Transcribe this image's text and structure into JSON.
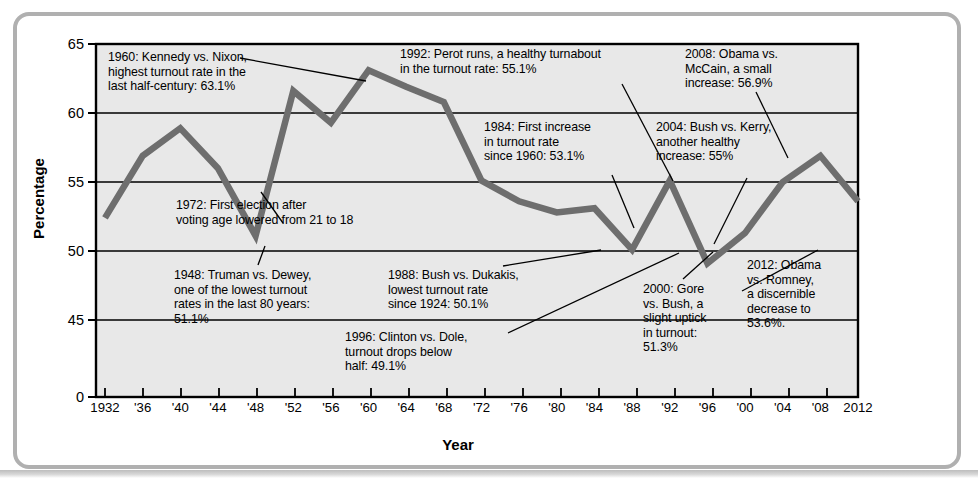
{
  "chart_data": {
    "type": "line",
    "title": "",
    "xlabel": "Year",
    "ylabel": "Percentage",
    "ylim": [
      44,
      65
    ],
    "yticks": [
      "0",
      "45",
      "50",
      "55",
      "60",
      "65"
    ],
    "grid": true,
    "legend": "none",
    "x": [
      1932,
      1936,
      1940,
      1944,
      1948,
      1952,
      1956,
      1960,
      1964,
      1968,
      1972,
      1976,
      1980,
      1984,
      1988,
      1992,
      1996,
      2000,
      2004,
      2008,
      2012
    ],
    "xtick_labels": [
      "1932",
      "'36",
      "'40",
      "'44",
      "'48",
      "'52",
      "'56",
      "'60",
      "'64",
      "'68",
      "'72",
      "'76",
      "'80",
      "'84",
      "'88",
      "'92",
      "'96",
      "'00",
      "'04",
      "'08",
      "2012"
    ],
    "values": [
      52.4,
      56.9,
      58.9,
      56.0,
      51.1,
      61.6,
      59.3,
      63.1,
      61.9,
      60.8,
      55.1,
      53.6,
      52.8,
      53.1,
      50.1,
      55.1,
      49.1,
      51.3,
      55.0,
      56.9,
      53.6
    ],
    "series_name": "Voter turnout rate",
    "line_color": "#6e6e6e",
    "plot_background": "#e8e8e8",
    "annotations": [
      {
        "id": "a1960",
        "text": "1960: Kennedy vs. Nixon,\nhighest turnout rate in the\nlast half-century: 63.1%"
      },
      {
        "id": "a1992",
        "text": "1992: Perot runs, a healthy turnabout\nin the turnout rate: 55.1%"
      },
      {
        "id": "a2008",
        "text": "2008: Obama vs.\nMcCain, a small\nincrease: 56.9%"
      },
      {
        "id": "a1984",
        "text": "1984: First increase\nin turnout rate\nsince 1960: 53.1%"
      },
      {
        "id": "a2004",
        "text": "2004: Bush vs. Kerry,\nanother healthy\nincrease: 55%"
      },
      {
        "id": "a1972",
        "text": "1972: First election after\nvoting age lowered from 21 to 18"
      },
      {
        "id": "a1948",
        "text": "1948: Truman vs. Dewey,\none of the lowest turnout\nrates in the last 80 years:\n51.1%"
      },
      {
        "id": "a1988",
        "text": "1988: Bush vs. Dukakis,\nlowest turnout rate\nsince 1924: 50.1%"
      },
      {
        "id": "a2012",
        "text": "2012: Obama\nvs. Romney,\na discernible\ndecrease to\n53.6%."
      },
      {
        "id": "a1996",
        "text": "1996: Clinton vs. Dole,\nturnout drops below\nhalf: 49.1%"
      },
      {
        "id": "a2000",
        "text": "2000: Gore\nvs. Bush, a\nslight uptick\nin turnout:\n51.3%"
      }
    ]
  },
  "axis": {
    "y_title": "Percentage",
    "x_title": "Year",
    "y_labels": [
      "65",
      "60",
      "55",
      "50",
      "45",
      "0"
    ]
  }
}
